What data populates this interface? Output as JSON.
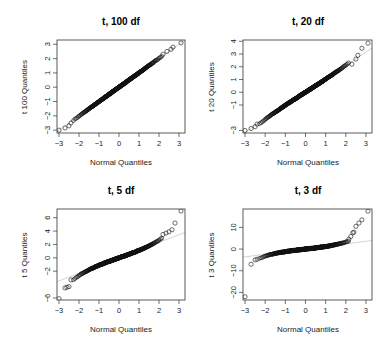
{
  "figure": {
    "panels": [
      {
        "title": "t, 100 df",
        "ylabel": "t 100 Quantiles",
        "xlabel": "Normal Quantiles"
      },
      {
        "title": "t, 20 df",
        "ylabel": "t 20 Quantiles",
        "xlabel": "Normal Quantiles"
      },
      {
        "title": "t, 5 df",
        "ylabel": "t 5 Quantiles",
        "xlabel": "Normal Quantiles"
      },
      {
        "title": "t, 3 df",
        "ylabel": "t 3 Quantiles",
        "xlabel": "Normal Quantiles"
      }
    ]
  },
  "chart_data": [
    {
      "type": "scatter",
      "title": "t, 100 df",
      "xlabel": "Normal Quantiles",
      "ylabel": "t 100 Quantiles",
      "xlim": [
        -3.1,
        3.3
      ],
      "ylim": [
        -3.2,
        3.3
      ],
      "xticks": [
        -3,
        -2,
        -1,
        0,
        1,
        2,
        3
      ],
      "yticks": [
        -3,
        -2,
        -1,
        0,
        1,
        2,
        3
      ],
      "reference_line": {
        "slope": 1.0,
        "intercept": 0.0
      },
      "tail_points": {
        "x": [
          -3.0,
          -2.7,
          -2.5,
          -2.4,
          2.2,
          2.4,
          2.6,
          2.7,
          3.1
        ],
        "y": [
          -3.0,
          -2.85,
          -2.7,
          -2.5,
          2.3,
          2.5,
          2.65,
          2.8,
          3.1
        ]
      },
      "grid": false
    },
    {
      "type": "scatter",
      "title": "t, 20 df",
      "xlabel": "Normal Quantiles",
      "ylabel": "t 20 Quantiles",
      "xlim": [
        -3.1,
        3.3
      ],
      "ylim": [
        -3.2,
        4.1
      ],
      "xticks": [
        -3,
        -2,
        -1,
        0,
        1,
        2,
        3
      ],
      "yticks": [
        -3,
        -1,
        0,
        1,
        2,
        3,
        4
      ],
      "reference_line": {
        "slope": 1.05,
        "intercept": 0.0
      },
      "tail_points": {
        "x": [
          -3.0,
          -2.7,
          -2.5,
          -2.4,
          2.3,
          2.5,
          2.6,
          2.8,
          3.1
        ],
        "y": [
          -3.0,
          -2.85,
          -2.7,
          -2.5,
          2.2,
          2.6,
          2.9,
          3.45,
          3.85
        ]
      },
      "grid": false
    },
    {
      "type": "scatter",
      "title": "t, 5 df",
      "xlabel": "Normal Quantiles",
      "ylabel": "t 5 Quantiles",
      "xlim": [
        -3.1,
        3.3
      ],
      "ylim": [
        -6.3,
        7.3
      ],
      "xticks": [
        -3,
        -2,
        -1,
        0,
        1,
        2,
        3
      ],
      "yticks": [
        -6,
        -2,
        0,
        2,
        4,
        6
      ],
      "reference_line": {
        "slope": 1.15,
        "intercept": 0.0
      },
      "tail_points": {
        "x": [
          -3.0,
          -2.7,
          -2.6,
          -2.5,
          -2.4,
          2.2,
          2.35,
          2.5,
          2.65,
          2.8,
          3.1
        ],
        "y": [
          -6.1,
          -4.5,
          -4.4,
          -4.3,
          -3.3,
          3.5,
          3.7,
          3.9,
          4.2,
          5.2,
          7.0
        ]
      },
      "grid": false
    },
    {
      "type": "scatter",
      "title": "t, 3 df",
      "xlabel": "Normal Quantiles",
      "ylabel": "t 3 Quantiles",
      "xlim": [
        -3.1,
        3.3
      ],
      "ylim": [
        -23.5,
        18.5
      ],
      "xticks": [
        -3,
        -2,
        -1,
        0,
        1,
        2,
        3
      ],
      "yticks": [
        -20,
        -10,
        0,
        10
      ],
      "reference_line": {
        "slope": 1.2,
        "intercept": 0.0
      },
      "tail_points": {
        "x": [
          -3.0,
          -2.7,
          -2.5,
          -2.4,
          2.15,
          2.25,
          2.35,
          2.4,
          2.5,
          2.65,
          2.8,
          3.1
        ],
        "y": [
          -22.0,
          -7.0,
          -5.0,
          -4.7,
          4.5,
          5.8,
          7.5,
          7.8,
          10.5,
          12.0,
          13.5,
          17.5
        ]
      },
      "grid": false
    }
  ]
}
